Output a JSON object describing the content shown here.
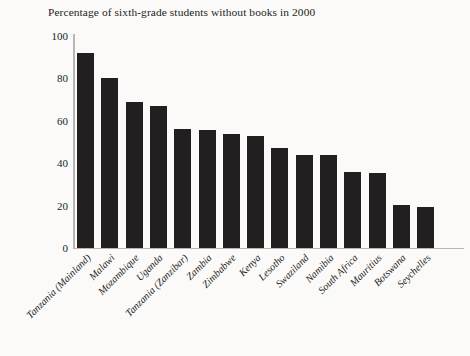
{
  "chart_data": {
    "type": "bar",
    "title": "Percentage of sixth-grade students without books in 2000",
    "xlabel": "",
    "ylabel": "",
    "ylim": [
      0,
      100
    ],
    "yticks": [
      0,
      20,
      40,
      60,
      80,
      100
    ],
    "grid": false,
    "legend": null,
    "orientation": "vertical",
    "bar_color": "#211f1f",
    "background_color": "#fbfaf8",
    "axis_color": "#b9b6b1",
    "categories": [
      "Tanzania (Mainland)",
      "Malawi",
      "Mozambique",
      "Uganda",
      "Tanzania (Zanzibar)",
      "Zambia",
      "Zimbabwe",
      "Kenya",
      "Lesotho",
      "Swaziland",
      "Namibia",
      "South Africa",
      "Mauritius",
      "Botswana",
      "Seychelles"
    ],
    "values": [
      92,
      80,
      69,
      67,
      56,
      55.5,
      54,
      53,
      47,
      44,
      44,
      36,
      35.5,
      20.5,
      19.5
    ]
  }
}
